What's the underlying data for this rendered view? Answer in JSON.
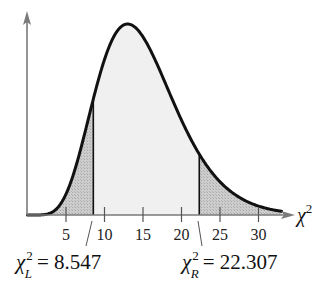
{
  "chart_data": {
    "type": "area",
    "title": "",
    "distribution": "chi-square",
    "xlabel": "χ²",
    "ylabel": "",
    "x_ticks": [
      5,
      10,
      15,
      20,
      25,
      30
    ],
    "x_tick_labels": [
      "5",
      "10",
      "15",
      "20",
      "25",
      "30"
    ],
    "xlim": [
      -0.5,
      36
    ],
    "grid": false,
    "critical_values": {
      "left": {
        "symbol": "χ",
        "superscript": "2",
        "subscript": "L",
        "value": 8.547,
        "label": "= 8.547"
      },
      "right": {
        "symbol": "χ",
        "superscript": "2",
        "subscript": "R",
        "value": 22.307,
        "label": "= 22.307"
      }
    },
    "regions": [
      {
        "name": "left-tail",
        "from": 0,
        "to": 8.547,
        "fill": "#c8c8c8",
        "pattern": "stipple"
      },
      {
        "name": "middle",
        "from": 8.547,
        "to": 22.307,
        "fill": "#f0f0f0"
      },
      {
        "name": "right-tail",
        "from": 22.307,
        "to": 33,
        "fill": "#c8c8c8",
        "pattern": "stipple"
      }
    ],
    "curve_peak_x": 13
  },
  "axis": {
    "x_label_symbol": "χ",
    "x_label_sup": "2"
  },
  "colors": {
    "curve": "#111111",
    "axis": "#7a7a7a",
    "tail_fill": "#c9c9c9",
    "middle_fill": "#f1f1f1"
  }
}
